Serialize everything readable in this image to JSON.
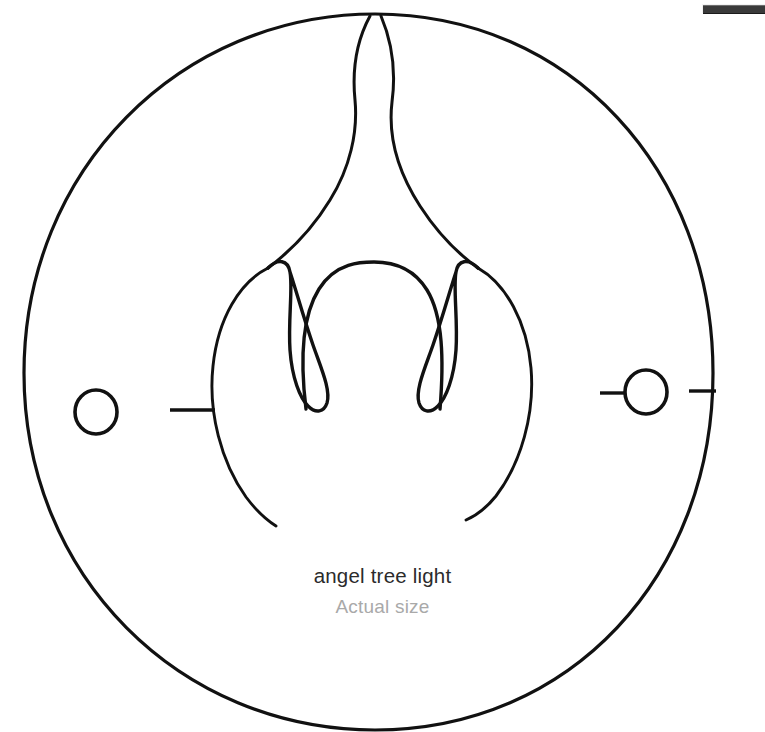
{
  "page": {
    "background_color": "#ffffff",
    "width": 765,
    "height": 732
  },
  "scrollbar": {
    "name": "horizontal-scrollbar",
    "thumb_color": "#3a3a3a",
    "track_color": "#f2f2f2"
  },
  "caption": {
    "title": "angel tree light",
    "subtitle": "Actual size",
    "title_color": "#2b2b2b",
    "subtitle_color": "#a9a9a9"
  },
  "drawing": {
    "name": "angel-tree-light-line-drawing",
    "stroke_color": "#111111",
    "parts": [
      {
        "name": "outer-ring",
        "label": "outer circle outline"
      },
      {
        "name": "body-outline",
        "label": "inner teardrop body outline"
      },
      {
        "name": "wing-lines",
        "label": "angel wing / flame lines from apex"
      },
      {
        "name": "center-arch",
        "label": "central inverted arch"
      },
      {
        "name": "left-hook",
        "label": "left hook flame"
      },
      {
        "name": "right-hook",
        "label": "right hook flame"
      },
      {
        "name": "left-bulb",
        "label": "left bulb circle"
      },
      {
        "name": "right-bulb",
        "label": "right bulb circle"
      },
      {
        "name": "left-inner-tick",
        "label": "left horizontal tick mark"
      },
      {
        "name": "right-inner-tick",
        "label": "right horizontal lead line"
      },
      {
        "name": "right-outer-tick",
        "label": "right edge tick mark"
      }
    ]
  }
}
